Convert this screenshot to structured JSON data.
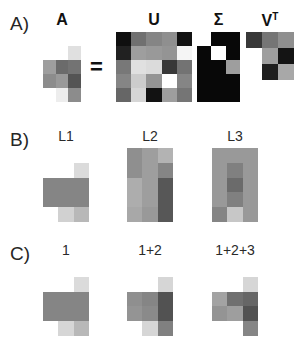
{
  "figure": {
    "width": 306,
    "height": 344,
    "background": "#ffffff",
    "equals_symbol": "="
  },
  "panels": {
    "a": {
      "label": "A)"
    },
    "b": {
      "label": "B)"
    },
    "c": {
      "label": "C)"
    }
  },
  "titles": {
    "a_matrix": "A",
    "u_matrix": "U",
    "sigma_matrix": "Σ",
    "vt_matrix_base": "V",
    "vt_matrix_sup": "T",
    "l1": "L1",
    "l2": "L2",
    "l3": "L3",
    "recon1": "1",
    "recon2": "1+2",
    "recon3": "1+2+3"
  },
  "chart_data": {
    "type": "heatmap",
    "colormap": "grayscale",
    "value_range": [
      0,
      1
    ],
    "matrices": [
      {
        "name": "A",
        "panel": "A",
        "rows": 5,
        "cols": 3,
        "values": [
          [
            1.0,
            1.0,
            1.0
          ],
          [
            1.0,
            1.0,
            0.88
          ],
          [
            0.62,
            0.42,
            0.45
          ],
          [
            0.55,
            0.6,
            0.33
          ],
          [
            1.0,
            0.93,
            0.55
          ]
        ]
      },
      {
        "name": "U",
        "panel": "A",
        "rows": 5,
        "cols": 5,
        "values": [
          [
            0.06,
            0.44,
            0.52,
            0.56,
            0.07
          ],
          [
            0.13,
            0.62,
            0.6,
            0.58,
            0.96
          ],
          [
            0.47,
            0.88,
            0.86,
            0.22,
            0.45
          ],
          [
            0.52,
            0.8,
            0.58,
            1.0,
            0.52
          ],
          [
            0.4,
            0.84,
            0.07,
            0.62,
            0.46
          ]
        ]
      },
      {
        "name": "Sigma",
        "panel": "A",
        "rows": 5,
        "cols": 3,
        "values": [
          [
            1.0,
            0.03,
            0.03
          ],
          [
            0.03,
            1.0,
            0.03
          ],
          [
            0.03,
            0.03,
            0.62
          ],
          [
            0.03,
            0.03,
            0.03
          ],
          [
            0.03,
            0.03,
            0.03
          ]
        ]
      },
      {
        "name": "VT",
        "panel": "A",
        "rows": 3,
        "cols": 3,
        "values": [
          [
            0.22,
            0.46,
            0.56
          ],
          [
            1.0,
            0.62,
            0.08
          ],
          [
            1.0,
            0.12,
            0.66
          ]
        ]
      },
      {
        "name": "L1",
        "panel": "B",
        "rows": 5,
        "cols": 3,
        "values": [
          [
            1.0,
            1.0,
            1.0
          ],
          [
            1.0,
            1.0,
            0.86
          ],
          [
            0.52,
            0.52,
            0.52
          ],
          [
            0.52,
            0.52,
            0.52
          ],
          [
            1.0,
            0.82,
            0.72
          ]
        ]
      },
      {
        "name": "L2",
        "panel": "B",
        "rows": 5,
        "cols": 3,
        "values": [
          [
            0.56,
            0.62,
            0.7
          ],
          [
            0.56,
            0.62,
            0.52
          ],
          [
            0.68,
            0.62,
            0.34
          ],
          [
            0.68,
            0.62,
            0.34
          ],
          [
            0.66,
            0.6,
            0.34
          ]
        ]
      },
      {
        "name": "L3",
        "panel": "B",
        "rows": 5,
        "cols": 3,
        "values": [
          [
            0.6,
            0.6,
            0.6
          ],
          [
            0.6,
            0.5,
            0.6
          ],
          [
            0.6,
            0.42,
            0.6
          ],
          [
            0.6,
            0.5,
            0.6
          ],
          [
            0.52,
            0.78,
            0.6
          ]
        ]
      },
      {
        "name": "Recon1",
        "panel": "C",
        "rows": 5,
        "cols": 3,
        "values": [
          [
            1.0,
            1.0,
            1.0
          ],
          [
            1.0,
            1.0,
            0.86
          ],
          [
            0.52,
            0.52,
            0.52
          ],
          [
            0.52,
            0.52,
            0.52
          ],
          [
            1.0,
            0.84,
            0.72
          ]
        ]
      },
      {
        "name": "Recon2",
        "panel": "C",
        "rows": 5,
        "cols": 3,
        "values": [
          [
            1.0,
            1.0,
            1.0
          ],
          [
            1.0,
            1.0,
            0.84
          ],
          [
            0.56,
            0.52,
            0.32
          ],
          [
            0.58,
            0.54,
            0.32
          ],
          [
            1.0,
            0.84,
            0.5
          ]
        ]
      },
      {
        "name": "Recon3",
        "panel": "C",
        "rows": 5,
        "cols": 3,
        "values": [
          [
            1.0,
            1.0,
            1.0
          ],
          [
            1.0,
            1.0,
            0.84
          ],
          [
            0.64,
            0.44,
            0.4
          ],
          [
            0.58,
            0.62,
            0.32
          ],
          [
            1.0,
            1.0,
            0.52
          ]
        ]
      }
    ]
  },
  "layout": {
    "matrices": [
      {
        "key": "A",
        "x": 43,
        "y": 32,
        "w": 38,
        "h": 70,
        "name": "matrix-a"
      },
      {
        "key": "U",
        "x": 116,
        "y": 32,
        "w": 76,
        "h": 70,
        "name": "matrix-u"
      },
      {
        "key": "Sigma",
        "x": 197,
        "y": 32,
        "w": 43,
        "h": 70,
        "name": "matrix-sigma"
      },
      {
        "key": "VT",
        "x": 246,
        "y": 32,
        "w": 48,
        "h": 48,
        "name": "matrix-vt"
      },
      {
        "key": "L1",
        "x": 43,
        "y": 148,
        "w": 46,
        "h": 74,
        "name": "matrix-l1"
      },
      {
        "key": "L2",
        "x": 127,
        "y": 148,
        "w": 46,
        "h": 74,
        "name": "matrix-l2"
      },
      {
        "key": "L3",
        "x": 212,
        "y": 148,
        "w": 46,
        "h": 74,
        "name": "matrix-l3"
      },
      {
        "key": "Recon1",
        "x": 43,
        "y": 262,
        "w": 46,
        "h": 74,
        "name": "matrix-recon1"
      },
      {
        "key": "Recon2",
        "x": 127,
        "y": 262,
        "w": 46,
        "h": 74,
        "name": "matrix-recon2"
      },
      {
        "key": "Recon3",
        "x": 212,
        "y": 262,
        "w": 46,
        "h": 74,
        "name": "matrix-recon3"
      }
    ]
  }
}
